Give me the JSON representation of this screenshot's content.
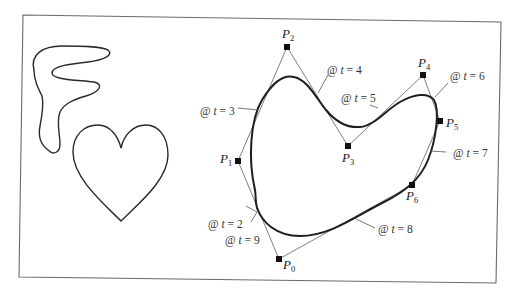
{
  "figure": {
    "control_points": [
      {
        "name": "P",
        "sub": "0",
        "x": 279,
        "y": 259
      },
      {
        "name": "P",
        "sub": "1",
        "x": 238,
        "y": 161
      },
      {
        "name": "P",
        "sub": "2",
        "x": 287,
        "y": 47
      },
      {
        "name": "P",
        "sub": "3",
        "x": 348,
        "y": 146
      },
      {
        "name": "P",
        "sub": "4",
        "x": 423,
        "y": 75
      },
      {
        "name": "P",
        "sub": "5",
        "x": 440,
        "y": 121
      },
      {
        "name": "P",
        "sub": "6",
        "x": 412,
        "y": 185
      }
    ],
    "parameter_labels": [
      {
        "at": "@",
        "t": "t",
        "eq": "= 2"
      },
      {
        "at": "@",
        "t": "t",
        "eq": "= 3"
      },
      {
        "at": "@",
        "t": "t",
        "eq": "= 4"
      },
      {
        "at": "@",
        "t": "t",
        "eq": "= 5"
      },
      {
        "at": "@",
        "t": "t",
        "eq": "= 6"
      },
      {
        "at": "@",
        "t": "t",
        "eq": "= 7"
      },
      {
        "at": "@",
        "t": "t",
        "eq": "= 8"
      },
      {
        "at": "@",
        "t": "t",
        "eq": "= 9"
      }
    ],
    "shapes": [
      "squiggle-F-shape",
      "heart-shape",
      "closed-spline-curve"
    ]
  }
}
